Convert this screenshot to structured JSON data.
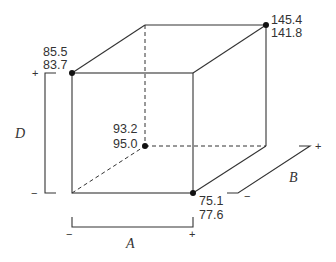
{
  "diagram": {
    "type": "cube-plot",
    "factors": {
      "A": {
        "label": "A",
        "low": "−",
        "high": "+"
      },
      "B": {
        "label": "B",
        "low": "−",
        "high": "+"
      },
      "D": {
        "label": "D",
        "low": "−",
        "high": "+"
      }
    },
    "corners": {
      "front_top_left": {
        "A": "-",
        "B": "-",
        "D": "+",
        "values": [
          "85.5",
          "83.7"
        ]
      },
      "back_top_right": {
        "A": "+",
        "B": "+",
        "D": "+",
        "values": [
          "145.4",
          "141.8"
        ]
      },
      "back_bottom_left": {
        "A": "-",
        "B": "+",
        "D": "-",
        "values": [
          "93.2",
          "95.0"
        ]
      },
      "front_bottom_right": {
        "A": "+",
        "B": "-",
        "D": "-",
        "values": [
          "75.1",
          "77.6"
        ]
      }
    }
  }
}
